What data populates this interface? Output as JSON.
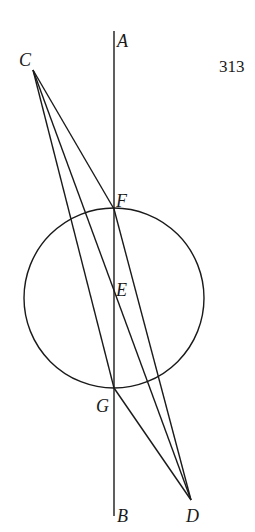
{
  "page_number": "313",
  "points": {
    "A": {
      "label": "A",
      "x": 114,
      "y": 31
    },
    "B": {
      "label": "B",
      "x": 114,
      "y": 516
    },
    "C": {
      "label": "C",
      "x": 33,
      "y": 70
    },
    "D": {
      "label": "D",
      "x": 191,
      "y": 500
    },
    "E": {
      "label": "E",
      "x": 114,
      "y": 298
    },
    "F": {
      "label": "F",
      "x": 114,
      "y": 209
    },
    "G": {
      "label": "G",
      "x": 114,
      "y": 388
    }
  },
  "circle": {
    "center": "E",
    "cx": 114,
    "cy": 298,
    "r": 90
  },
  "segments": [
    {
      "from": "A",
      "to": "B"
    },
    {
      "from": "C",
      "to": "F"
    },
    {
      "from": "C",
      "to": "G"
    },
    {
      "from": "C",
      "to": "D",
      "through": "E"
    },
    {
      "from": "F",
      "to": "D"
    },
    {
      "from": "G",
      "to": "D"
    }
  ]
}
